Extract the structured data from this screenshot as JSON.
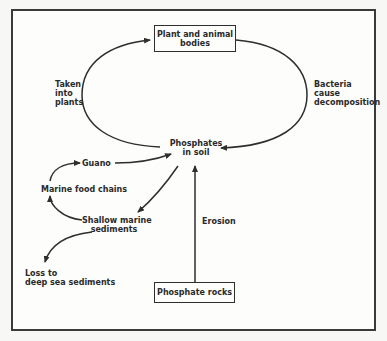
{
  "diagram": {
    "nodes": {
      "plant_animal_bodies": "Plant and animal\nbodies",
      "phosphates_in_soil": "Phosphates\nin soil",
      "phosphate_rocks": "Phosphate rocks",
      "guano": "Guano",
      "marine_food_chains": "Marine food chains",
      "shallow_marine_sediments": "Shallow marine\nsediments",
      "loss_deep_sea": "Loss to\ndeep sea sediments"
    },
    "edge_labels": {
      "taken_into_plants": "Taken\ninto\nplants",
      "bacteria_decomposition": "Bacteria\ncause\ndecomposition",
      "erosion": "Erosion"
    },
    "edges": [
      {
        "from": "phosphates_in_soil",
        "to": "plant_animal_bodies",
        "label": "Taken into plants"
      },
      {
        "from": "plant_animal_bodies",
        "to": "phosphates_in_soil",
        "label": "Bacteria cause decomposition"
      },
      {
        "from": "phosphate_rocks",
        "to": "phosphates_in_soil",
        "label": "Erosion"
      },
      {
        "from": "phosphates_in_soil",
        "to": "shallow_marine_sediments",
        "label": ""
      },
      {
        "from": "shallow_marine_sediments",
        "to": "marine_food_chains",
        "label": ""
      },
      {
        "from": "marine_food_chains",
        "to": "guano",
        "label": ""
      },
      {
        "from": "guano",
        "to": "phosphates_in_soil",
        "label": ""
      },
      {
        "from": "shallow_marine_sediments",
        "to": "loss_deep_sea",
        "label": ""
      }
    ],
    "colors": {
      "line": "#2e2e2e",
      "background": "#fdfdfc"
    }
  }
}
